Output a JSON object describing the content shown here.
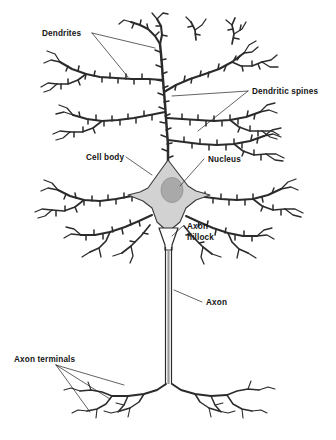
{
  "figure": {
    "background_color": "#ffffff",
    "ink_color": "#2b2b2b",
    "width": 336,
    "height": 440
  },
  "labels": {
    "dendrites": "Dendrites",
    "dendritic_spines": "Dendritic spines",
    "cell_body": "Cell body",
    "nucleus": "Nucleus",
    "axon_hillock_line1": "Axon",
    "axon_hillock_line2": "hillock",
    "axon": "Axon",
    "axon_terminals": "Axon terminals"
  },
  "parts": {
    "soma": {
      "name": "Cell body",
      "fill_color": "#d2d2d2",
      "stroke_color": "#3a3a3a"
    },
    "nucleus": {
      "name": "Nucleus",
      "fill_color": "#a9a9a9",
      "stroke_color": "#8c8c8c"
    },
    "axon": {
      "name": "Axon",
      "stroke_color": "#2b2b2b"
    },
    "axon_hillock": {
      "name": "Axon hillock"
    },
    "dendrites": {
      "name": "Dendrites"
    },
    "dendritic_spines": {
      "name": "Dendritic spines"
    },
    "axon_terminals": {
      "name": "Axon terminals"
    }
  }
}
